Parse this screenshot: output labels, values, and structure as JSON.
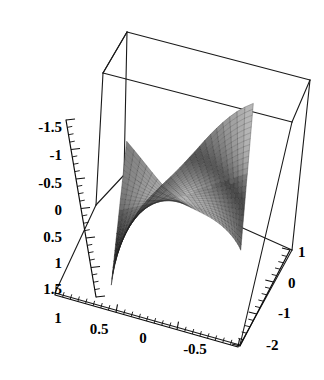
{
  "chart_data": {
    "type": "surface3d",
    "title": "",
    "subtitle": "",
    "xlabel": "",
    "ylabel": "",
    "zlabel": "",
    "grid": true,
    "legend": "none",
    "background_color": "#ffffff",
    "line_color": "#1a1a1a",
    "surface_shading": "grayscale",
    "mesh": true,
    "bounding_box": true,
    "projection": "orthographic",
    "axes": {
      "x": {
        "label": "",
        "range": [
          -0.75,
          1
        ],
        "ticks": [
          1,
          0.5,
          0,
          -0.5
        ],
        "tick_labels": [
          "1",
          "0.5",
          "0",
          "-0.5"
        ],
        "position": "bottom-left"
      },
      "y": {
        "label": "",
        "range": [
          -2,
          1
        ],
        "ticks": [
          1,
          0,
          -1,
          -2
        ],
        "tick_labels": [
          "1",
          "0",
          "-1",
          "-2"
        ],
        "position": "bottom-right"
      },
      "z": {
        "label": "",
        "range": [
          -1.75,
          1.75
        ],
        "ticks": [
          -1.5,
          -1,
          -0.5,
          0,
          0.5,
          1,
          1.5
        ],
        "tick_labels": [
          "-1.5",
          "-1",
          "-0.5",
          "0",
          "0.5",
          "1",
          "1.5"
        ],
        "position": "left",
        "direction": "increasing-downward"
      }
    },
    "z_tick_labels": [
      "-1.5",
      "-1",
      "-0.5",
      "0",
      "0.5",
      "1",
      "1.5"
    ],
    "x_tick_labels": [
      "1",
      "0.5",
      "0",
      "-0.5"
    ],
    "y_tick_labels": [
      "1",
      "0",
      "-1",
      "-2"
    ],
    "surface_description": "ruled saddle-like surface, light lobe at left, dark funnel at right"
  },
  "zTicks": [
    {
      "label": "-1.5",
      "lx": 62,
      "ly": 129,
      "tx": 68,
      "ty": 126
    },
    {
      "label": "-1",
      "lx": 62,
      "ly": 157,
      "tx": 72,
      "ty": 155
    },
    {
      "label": "-0.5",
      "lx": 62,
      "ly": 185,
      "tx": 76,
      "ty": 183
    },
    {
      "label": "0",
      "lx": 62,
      "ly": 212,
      "tx": 80,
      "ty": 211
    },
    {
      "label": "0.5",
      "lx": 62,
      "ly": 239,
      "tx": 84,
      "ty": 238
    },
    {
      "label": "1",
      "lx": 62,
      "ly": 265,
      "tx": 88,
      "ty": 264
    },
    {
      "label": "1.5",
      "lx": 62,
      "ly": 291,
      "tx": 92,
      "ty": 290
    }
  ],
  "xTicks": [
    {
      "label": "1",
      "lx": 58,
      "ly": 320
    },
    {
      "label": "0.5",
      "lx": 99,
      "ly": 331
    },
    {
      "label": "0",
      "lx": 143,
      "ly": 340
    },
    {
      "label": "-0.5",
      "lx": 195,
      "ly": 351
    }
  ],
  "yTicks": [
    {
      "label": "1",
      "lx": 298,
      "ly": 254
    },
    {
      "label": "0",
      "lx": 288,
      "ly": 285
    },
    {
      "label": "-1",
      "lx": 278,
      "ly": 315
    },
    {
      "label": "-2",
      "lx": 266,
      "ly": 347
    }
  ]
}
